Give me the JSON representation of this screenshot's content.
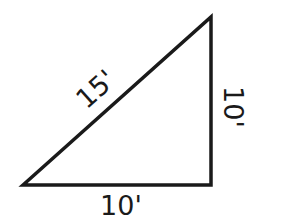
{
  "diagram": {
    "type": "right-triangle",
    "stroke_color": "#1a1a1a",
    "background": "#ffffff",
    "vertices": {
      "bottom_left": [
        23,
        185
      ],
      "top_right": [
        211,
        17
      ],
      "bottom_right": [
        211,
        185
      ]
    },
    "labels": {
      "hypotenuse": "15'",
      "right_side": "10'",
      "bottom_side": "10'"
    }
  }
}
